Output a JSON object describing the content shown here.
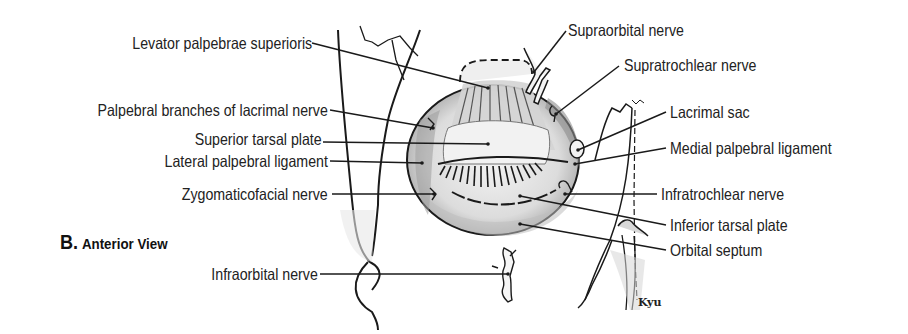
{
  "figure": {
    "panel_letter": "B.",
    "panel_title": "Anterior View",
    "artist_signature": "Kyu",
    "colors": {
      "ink": "#1a1a1a",
      "shade_dark": "#9a9a9a",
      "shade_mid": "#c8c8c8",
      "shade_light": "#e6e6e6",
      "background": "#ffffff"
    },
    "labels_left": [
      {
        "id": "levator",
        "text": "Levator palpebrae superioris"
      },
      {
        "id": "lacrimal_branches",
        "text": "Palpebral branches of lacrimal nerve"
      },
      {
        "id": "superior_tarsal",
        "text": "Superior tarsal plate"
      },
      {
        "id": "lateral_ligament",
        "text": "Lateral palpebral ligament"
      },
      {
        "id": "zygomaticofacial",
        "text": "Zygomaticofacial nerve"
      },
      {
        "id": "infraorbital",
        "text": "Infraorbital nerve"
      }
    ],
    "labels_right": [
      {
        "id": "supraorbital",
        "text": "Supraorbital nerve"
      },
      {
        "id": "supratrochlear",
        "text": "Supratrochlear nerve"
      },
      {
        "id": "lacrimal_sac",
        "text": "Lacrimal sac"
      },
      {
        "id": "medial_ligament",
        "text": "Medial palpebral ligament"
      },
      {
        "id": "infratrochlear",
        "text": "Infratrochlear nerve"
      },
      {
        "id": "inferior_tarsal",
        "text": "Inferior tarsal plate"
      },
      {
        "id": "orbital_septum",
        "text": "Orbital septum"
      }
    ]
  }
}
